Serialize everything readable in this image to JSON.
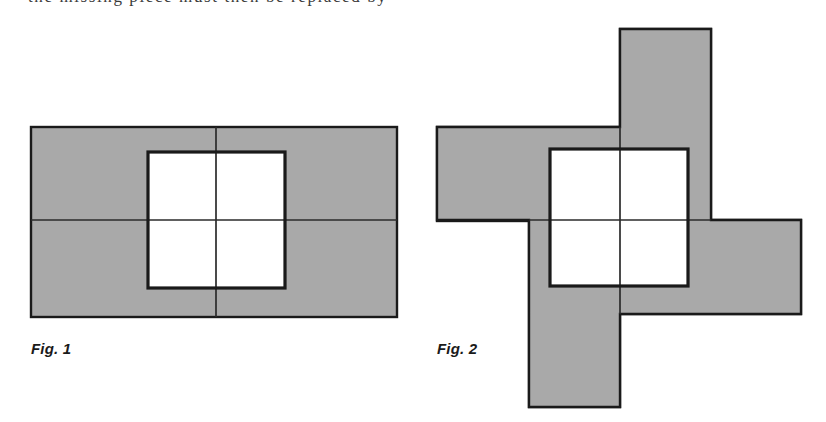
{
  "page": {
    "width": 826,
    "height": 422,
    "background_color": "#ffffff",
    "cut_off_text_line": "the missing piece must then be replaced by"
  },
  "palette": {
    "shaded_fill": "#a9a9a9",
    "outline": "#1a1a1a",
    "white_fill": "#ffffff",
    "thin_line": "#2b2b2b"
  },
  "figures": [
    {
      "id": "fig1",
      "caption": "Fig. 1",
      "description": "Shaded rectangle split into four equal quadrants by a vertical and a horizontal line, with an unshaded square centred on the intersection",
      "shaded_rect": {
        "x": 31,
        "y": 127,
        "width": 366,
        "height": 190
      },
      "divider_vertical_x": 216,
      "divider_horizontal_y": 220,
      "white_square": {
        "x": 148,
        "y": 152,
        "width": 137,
        "height": 136
      },
      "quadrant_count": 4
    },
    {
      "id": "fig2",
      "caption": "Fig. 2",
      "description": "Four shaded rectangles arranged as a pinwheel around a central unshaded square",
      "center": {
        "x": 620,
        "y": 220
      },
      "arms": [
        {
          "name": "top-arm",
          "x": 620,
          "y": 29,
          "width": 91,
          "height": 191
        },
        {
          "name": "left-arm",
          "x": 437,
          "y": 127,
          "width": 183,
          "height": 94
        },
        {
          "name": "right-arm",
          "x": 620,
          "y": 220,
          "width": 181,
          "height": 94
        },
        {
          "name": "bottom-arm",
          "x": 529,
          "y": 220,
          "width": 91,
          "height": 187
        }
      ],
      "white_square": {
        "x": 550,
        "y": 149,
        "width": 138,
        "height": 137
      },
      "divider_vertical_x": 620,
      "divider_horizontal_y": 220
    }
  ],
  "strokes": {
    "outline_width": 2,
    "white_square_border_width": 3,
    "thin_divider_width": 1.6
  }
}
